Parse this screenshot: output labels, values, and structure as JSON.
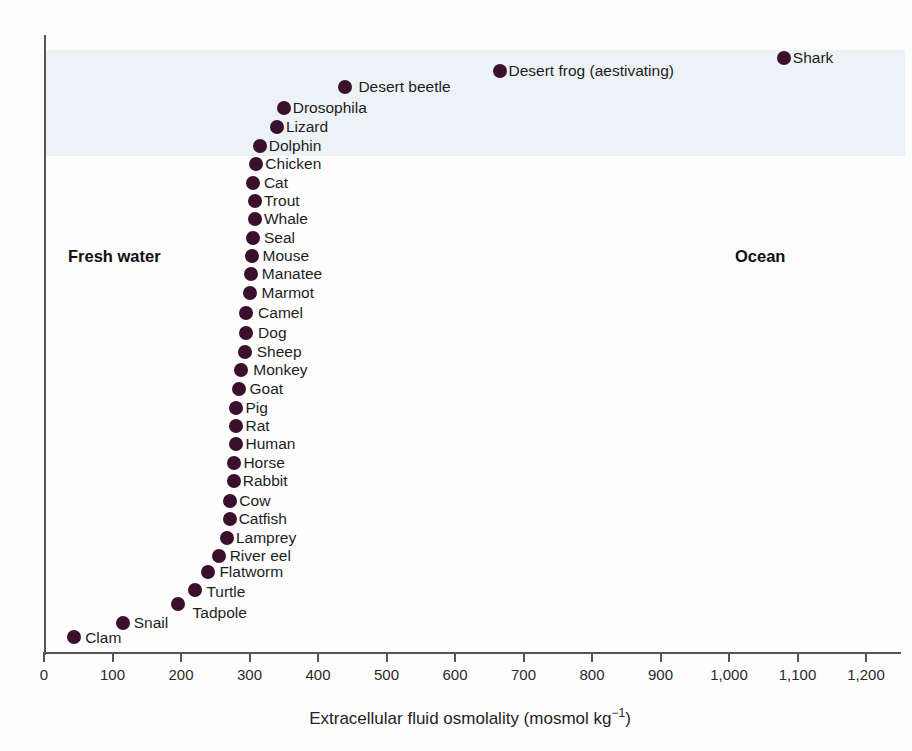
{
  "region_labels": {
    "left": "Fresh water",
    "right": "Ocean"
  },
  "axis_title": {
    "pre": "Extracellular fluid osmolality (mosmol kg",
    "sup": "−1",
    "post": ")"
  },
  "colors": {
    "dot": "#3a102c",
    "band": "#edf2f6",
    "axis": "#555555",
    "text": "#1d1d1d"
  },
  "chart_data": {
    "type": "scatter",
    "title": "",
    "xlabel": "Extracellular fluid osmolality (mosmol kg−1)",
    "ylabel": "",
    "xlim": [
      0,
      1200
    ],
    "grid": false,
    "annotations": [
      "Fresh water",
      "Ocean"
    ],
    "x_ticks": [
      {
        "value": 0,
        "label": "0"
      },
      {
        "value": 100,
        "label": "100"
      },
      {
        "value": 200,
        "label": "200"
      },
      {
        "value": 300,
        "label": "300"
      },
      {
        "value": 400,
        "label": "400"
      },
      {
        "value": 500,
        "label": "500"
      },
      {
        "value": 600,
        "label": "600"
      },
      {
        "value": 700,
        "label": "700"
      },
      {
        "value": 800,
        "label": "800"
      },
      {
        "value": 900,
        "label": "900"
      },
      {
        "value": 1000,
        "label": "1,000"
      },
      {
        "value": 1100,
        "label": "1,100"
      },
      {
        "value": 1200,
        "label": "1,200"
      }
    ],
    "points": [
      {
        "name": "Shark",
        "value": 1080,
        "y_px": 58,
        "label_dx": 0,
        "label_dy": 0
      },
      {
        "name": "Desert frog (aestivating)",
        "value": 665,
        "y_px": 71,
        "label_dx": 0,
        "label_dy": 0
      },
      {
        "name": "Desert beetle",
        "value": 440,
        "y_px": 87,
        "label_dx": 4,
        "label_dy": 0
      },
      {
        "name": "Drosophila",
        "value": 350,
        "y_px": 108,
        "label_dx": 0,
        "label_dy": 0
      },
      {
        "name": "Lizard",
        "value": 340,
        "y_px": 127,
        "label_dx": 0,
        "label_dy": 0
      },
      {
        "name": "Dolphin",
        "value": 315,
        "y_px": 146,
        "label_dx": 0,
        "label_dy": 0
      },
      {
        "name": "Chicken",
        "value": 310,
        "y_px": 164,
        "label_dx": 0,
        "label_dy": 0
      },
      {
        "name": "Cat",
        "value": 305,
        "y_px": 183,
        "label_dx": 2,
        "label_dy": 0
      },
      {
        "name": "Trout",
        "value": 308,
        "y_px": 201,
        "label_dx": 0,
        "label_dy": 0
      },
      {
        "name": "Whale",
        "value": 308,
        "y_px": 219,
        "label_dx": 0,
        "label_dy": 0
      },
      {
        "name": "Seal",
        "value": 305,
        "y_px": 238,
        "label_dx": 2,
        "label_dy": 0
      },
      {
        "name": "Mouse",
        "value": 303,
        "y_px": 256,
        "label_dx": 2,
        "label_dy": 0
      },
      {
        "name": "Manatee",
        "value": 302,
        "y_px": 274,
        "label_dx": 2,
        "label_dy": 0
      },
      {
        "name": "Marmot",
        "value": 300,
        "y_px": 293,
        "label_dx": 3,
        "label_dy": 0
      },
      {
        "name": "Camel",
        "value": 295,
        "y_px": 313,
        "label_dx": 3,
        "label_dy": 0
      },
      {
        "name": "Dog",
        "value": 295,
        "y_px": 333,
        "label_dx": 3,
        "label_dy": 0
      },
      {
        "name": "Sheep",
        "value": 293,
        "y_px": 352,
        "label_dx": 3,
        "label_dy": 0
      },
      {
        "name": "Monkey",
        "value": 288,
        "y_px": 370,
        "label_dx": 3,
        "label_dy": 0
      },
      {
        "name": "Goat",
        "value": 284,
        "y_px": 389,
        "label_dx": 2,
        "label_dy": 0
      },
      {
        "name": "Pig",
        "value": 281,
        "y_px": 408,
        "label_dx": 0,
        "label_dy": 0
      },
      {
        "name": "Rat",
        "value": 281,
        "y_px": 426,
        "label_dx": 0,
        "label_dy": 0
      },
      {
        "name": "Human",
        "value": 281,
        "y_px": 444,
        "label_dx": 0,
        "label_dy": 0
      },
      {
        "name": "Horse",
        "value": 278,
        "y_px": 463,
        "label_dx": 0,
        "label_dy": 0
      },
      {
        "name": "Rabbit",
        "value": 277,
        "y_px": 481,
        "label_dx": 0,
        "label_dy": 0
      },
      {
        "name": "Cow",
        "value": 272,
        "y_px": 501,
        "label_dx": 0,
        "label_dy": 0
      },
      {
        "name": "Catfish",
        "value": 271,
        "y_px": 519,
        "label_dx": 0,
        "label_dy": 0
      },
      {
        "name": "Lamprey",
        "value": 267,
        "y_px": 538,
        "label_dx": 0,
        "label_dy": 0
      },
      {
        "name": "River eel",
        "value": 255,
        "y_px": 556,
        "label_dx": 2,
        "label_dy": 0
      },
      {
        "name": "Flatworm",
        "value": 240,
        "y_px": 572,
        "label_dx": 2,
        "label_dy": 0
      },
      {
        "name": "Turtle",
        "value": 221,
        "y_px": 590,
        "label_dx": 2,
        "label_dy": 2
      },
      {
        "name": "Tadpole",
        "value": 195,
        "y_px": 604,
        "label_dx": 6,
        "label_dy": 9
      },
      {
        "name": "Snail",
        "value": 115,
        "y_px": 623,
        "label_dx": 2,
        "label_dy": 0
      },
      {
        "name": "Clam",
        "value": 44,
        "y_px": 637,
        "label_dx": 2,
        "label_dy": 1
      }
    ]
  }
}
